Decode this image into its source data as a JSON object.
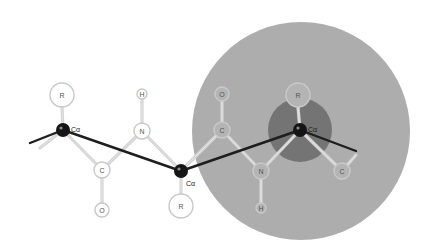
{
  "diagram": {
    "type": "protein backbone / peptide chain diagram",
    "colors": {
      "background": "#ffffff",
      "outer_sphere": "#a9a9a9",
      "inner_sphere": "#6e6e6e",
      "backbone_trace": "#1e1e1e",
      "alpha_carbon": "#151515",
      "atom_ring": "#c8c8c8",
      "bond": "#d4d4d4"
    },
    "spheres": [
      {
        "name": "outer-cutoff-sphere",
        "cx": 301,
        "cy": 131,
        "r": 109
      },
      {
        "name": "inner-cutoff-sphere",
        "cx": 300,
        "cy": 130,
        "r": 32
      }
    ],
    "backbone_trace": [
      [
        30,
        143
      ],
      [
        63,
        130
      ],
      [
        181,
        171
      ],
      [
        300,
        130
      ],
      [
        356,
        151
      ]
    ],
    "alpha_carbons": [
      {
        "id": "ca1",
        "label": "Cα",
        "x": 63,
        "y": 130,
        "label_x": 71,
        "label_y": 129
      },
      {
        "id": "ca2",
        "label": "Cα",
        "x": 181,
        "y": 171,
        "label_x": 186,
        "label_y": 183
      },
      {
        "id": "ca3",
        "label": "Cα",
        "x": 300,
        "y": 130,
        "label_x": 308,
        "label_y": 129
      }
    ],
    "atoms": [
      {
        "id": "r1",
        "label": "R",
        "x": 62,
        "y": 95,
        "r": 12
      },
      {
        "id": "c1",
        "label": "C",
        "x": 102,
        "y": 170,
        "r": 8
      },
      {
        "id": "o1",
        "label": "O",
        "x": 102,
        "y": 210,
        "r": 7
      },
      {
        "id": "n1",
        "label": "N",
        "x": 142,
        "y": 131,
        "r": 8
      },
      {
        "id": "h1",
        "label": "H",
        "x": 142,
        "y": 94,
        "r": 5
      },
      {
        "id": "r2",
        "label": "R",
        "x": 181,
        "y": 206,
        "r": 12
      },
      {
        "id": "c2",
        "label": "C",
        "x": 222,
        "y": 130,
        "r": 8
      },
      {
        "id": "o2",
        "label": "O",
        "x": 222,
        "y": 94,
        "r": 7
      },
      {
        "id": "n2",
        "label": "N",
        "x": 261,
        "y": 171,
        "r": 8
      },
      {
        "id": "h2",
        "label": "H",
        "x": 261,
        "y": 208,
        "r": 5
      },
      {
        "id": "r3",
        "label": "R",
        "x": 298,
        "y": 95,
        "r": 12
      },
      {
        "id": "c3",
        "label": "C",
        "x": 342,
        "y": 171,
        "r": 8
      }
    ],
    "bonds": [
      [
        40,
        148,
        63,
        130
      ],
      [
        63,
        130,
        62,
        107
      ],
      [
        63,
        130,
        102,
        170
      ],
      [
        102,
        170,
        102,
        203
      ],
      [
        102,
        170,
        142,
        131
      ],
      [
        142,
        131,
        142,
        99
      ],
      [
        142,
        131,
        181,
        171
      ],
      [
        181,
        171,
        181,
        194
      ],
      [
        181,
        171,
        222,
        130
      ],
      [
        222,
        130,
        222,
        101
      ],
      [
        222,
        130,
        261,
        171
      ],
      [
        261,
        171,
        261,
        203
      ],
      [
        261,
        171,
        300,
        130
      ],
      [
        300,
        130,
        298,
        107
      ],
      [
        300,
        130,
        342,
        171
      ],
      [
        342,
        171,
        356,
        155
      ]
    ]
  }
}
